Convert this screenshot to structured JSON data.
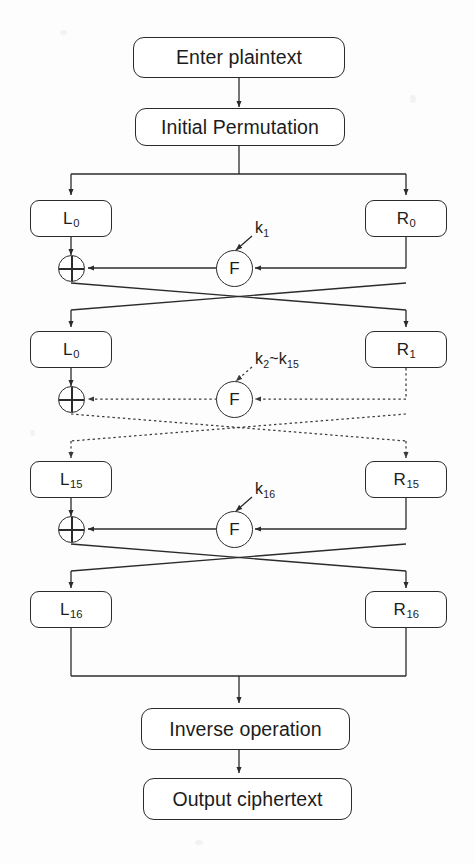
{
  "diagram": {
    "stroke_color": "#2b2b2b",
    "background_color": "#fdfdfd",
    "nodes": {
      "enter_plaintext": "Enter plaintext",
      "initial_permutation": "Initial Permutation",
      "inverse_operation": "Inverse operation",
      "output_ciphertext": "Output ciphertext",
      "f_function": "F"
    },
    "rounds": [
      {
        "index": 1,
        "left_label": "L",
        "left_sub": "0",
        "right_label": "R",
        "right_sub": "0",
        "key_label": "k",
        "key_sub": "1",
        "line_style": "solid"
      },
      {
        "index": 2,
        "left_label": "L",
        "left_sub": "0",
        "right_label": "R",
        "right_sub": "1",
        "key_label": "k",
        "key_sub": "2",
        "key_label2": "~k",
        "key_sub2": "15",
        "line_style": "dotted"
      },
      {
        "index": 3,
        "left_label": "L",
        "left_sub": "15",
        "right_label": "R",
        "right_sub": "15",
        "key_label": "k",
        "key_sub": "16",
        "line_style": "solid"
      }
    ],
    "final": {
      "left_label": "L",
      "left_sub": "16",
      "right_label": "R",
      "right_sub": "16"
    }
  }
}
